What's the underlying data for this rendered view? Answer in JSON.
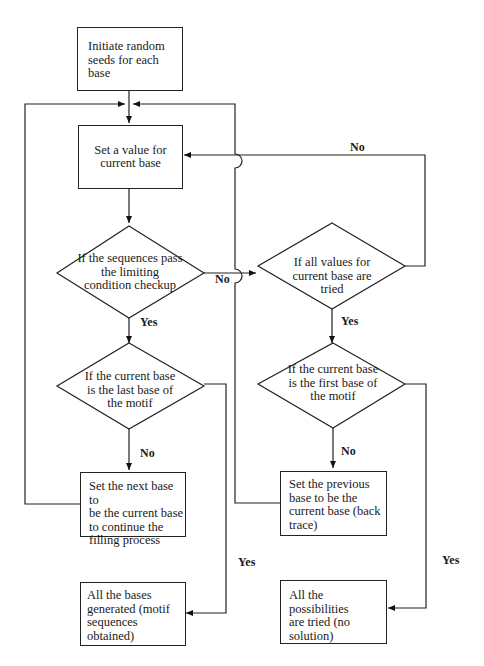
{
  "flowchart": {
    "nodes": {
      "initiate": {
        "type": "process",
        "text": "Initiate random seeds for each base"
      },
      "set_value": {
        "type": "process",
        "text": "Set a value for current base"
      },
      "check_limit": {
        "type": "decision",
        "text": "If the sequences pass the limiting condition checkup"
      },
      "all_values_tried": {
        "type": "decision",
        "text": "If all values for current base are tried"
      },
      "is_last_base": {
        "type": "decision",
        "text": "If the current base is the last base of the motif"
      },
      "is_first_base": {
        "type": "decision",
        "text": "If the current base is the first base of the motif"
      },
      "set_next": {
        "type": "process",
        "text": "Set the next base to be the current base to continue the filling process"
      },
      "set_previous": {
        "type": "process",
        "text": "Set the previous base to be the current base (back trace)"
      },
      "all_generated": {
        "type": "terminal",
        "text": "All the bases generated (motif sequences obtained)"
      },
      "no_solution": {
        "type": "terminal",
        "text": "All the possibilities are tried (no solution)"
      }
    },
    "edges": [
      {
        "from": "initiate",
        "to": "set_value",
        "label": ""
      },
      {
        "from": "set_value",
        "to": "check_limit",
        "label": ""
      },
      {
        "from": "check_limit",
        "to": "is_last_base",
        "label": "Yes"
      },
      {
        "from": "check_limit",
        "to": "all_values_tried",
        "label": "No"
      },
      {
        "from": "all_values_tried",
        "to": "set_value",
        "label": "No"
      },
      {
        "from": "all_values_tried",
        "to": "is_first_base",
        "label": "Yes"
      },
      {
        "from": "is_last_base",
        "to": "set_next",
        "label": "No"
      },
      {
        "from": "is_last_base",
        "to": "all_generated",
        "label": "Yes"
      },
      {
        "from": "is_first_base",
        "to": "set_previous",
        "label": "No"
      },
      {
        "from": "is_first_base",
        "to": "no_solution",
        "label": "Yes"
      },
      {
        "from": "set_next",
        "to": "set_value",
        "label": ""
      },
      {
        "from": "set_previous",
        "to": "set_value",
        "label": ""
      }
    ]
  },
  "text": {
    "initiate": [
      "Initiate random",
      "seeds for each",
      "base"
    ],
    "set_value": [
      "Set a value for",
      "current base"
    ],
    "check_limit": [
      "If the sequences pass",
      "the limiting",
      "condition checkup"
    ],
    "all_values_tried": [
      "If all values for",
      "current base are",
      "tried"
    ],
    "is_last_base": [
      "If the current base",
      "is the last base of",
      "the motif"
    ],
    "is_first_base": [
      "If the current base",
      "is the first base of",
      "the motif"
    ],
    "set_next": [
      "Set the next base to",
      "be the current base",
      "to continue the",
      "filling process"
    ],
    "set_previous": [
      "Set the previous",
      "base to be the",
      "current base (back",
      "trace)"
    ],
    "all_generated": [
      "All the bases",
      "generated (motif",
      "sequences",
      "obtained)"
    ],
    "no_solution": [
      "All the possibilities",
      "are tried (no",
      "solution)"
    ]
  },
  "labels": {
    "no_top": "No",
    "no_check": "No",
    "yes_check": "Yes",
    "yes_all_tried": "Yes",
    "no_last": "No",
    "no_first": "No",
    "yes_last": "Yes",
    "yes_first": "Yes"
  }
}
